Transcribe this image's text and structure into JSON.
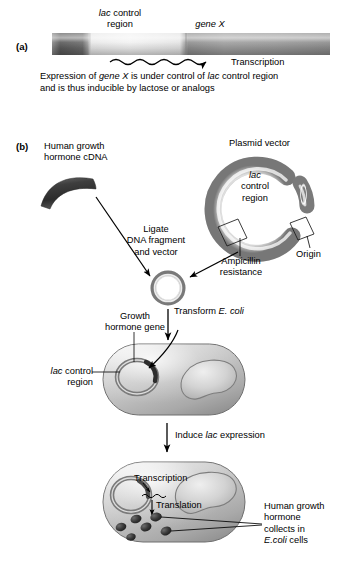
{
  "figure": {
    "panels": [
      {
        "id": "a",
        "label": "(a)",
        "dna_map": {
          "segments": [
            {
              "name": "upstream-dna",
              "label": ""
            },
            {
              "name": "lac-control-region",
              "label": "lac control region"
            },
            {
              "name": "gene-x",
              "label": "gene X"
            }
          ],
          "label_lac_line1": "lac",
          "label_lac_line2": "control",
          "label_lac_line3": "region",
          "label_gene_x_italic": "gene X",
          "transcription_label": "Transcription"
        },
        "caption_line1_pre": "Expression of ",
        "caption_line1_italic1": "gene X",
        "caption_line1_mid": " is under control of ",
        "caption_line1_italic2": "lac",
        "caption_line1_post": " control region",
        "caption_line2": "and is thus inducible by lactose or analogs"
      },
      {
        "id": "b",
        "label": "(b)",
        "cdna_label_line1": "Human growth",
        "cdna_label_line2": "hormone cDNA",
        "plasmid_label": "Plasmid vector",
        "plasmid_lac_line1": "lac",
        "plasmid_lac_line2": "control",
        "plasmid_lac_line3": "region",
        "ampicillin_line1": "Ampicillin",
        "ampicillin_line2": "resistance",
        "origin_label": "Origin",
        "ligate_line1": "Ligate",
        "ligate_line2": "DNA fragment",
        "ligate_line3": "and vector",
        "transform_pre": "Transform ",
        "transform_italic": "E. coli",
        "growth_gene_line1": "Growth",
        "growth_gene_line2": "hormone gene",
        "cell_lac_line1": "lac control",
        "cell_lac_line2": "region",
        "induce_pre": "Induce ",
        "induce_italic": "lac",
        "induce_post": " expression",
        "transcription_label": "Transcription",
        "translation_label": "Translation",
        "product_line1": "Human growth",
        "product_line2": "hormone",
        "product_line3": "collects in",
        "product_line4_italic": "E.coli",
        "product_line4_post": " cells"
      }
    ]
  },
  "colors": {
    "ink": "#000000",
    "dna_dark": "#4e4e4e",
    "dna_light": "#e6e6e6",
    "gene_mid": "#8e8e8e",
    "cell_fill": "#c9c9c9",
    "cell_edge": "#6f6f6f",
    "granule": "#3a3a3a"
  }
}
